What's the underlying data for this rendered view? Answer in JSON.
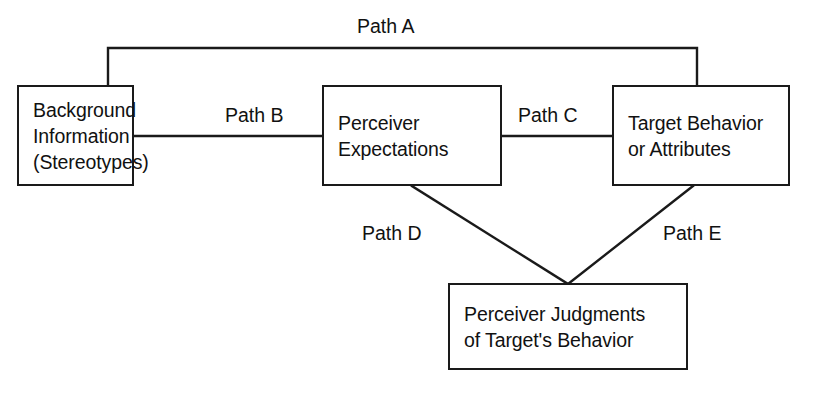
{
  "diagram": {
    "type": "path-model-flow-diagram",
    "stroke_color": "#1a1a1a",
    "background_color": "#ffffff",
    "text_color": "#111111",
    "nodes": [
      {
        "id": "background-information",
        "lines": [
          "Background",
          "Information",
          "(Stereotypes)"
        ],
        "x": 17,
        "y": 85,
        "width": 117,
        "height": 101,
        "align": "left"
      },
      {
        "id": "perceiver-expectations",
        "lines": [
          "Perceiver",
          "Expectations"
        ],
        "x": 322,
        "y": 85,
        "width": 180,
        "height": 101,
        "align": "left"
      },
      {
        "id": "target-behavior",
        "lines": [
          "Target Behavior",
          "or Attributes"
        ],
        "x": 612,
        "y": 85,
        "width": 178,
        "height": 101,
        "align": "left"
      },
      {
        "id": "perceiver-judgments",
        "lines": [
          "Perceiver Judgments",
          "of Target's Behavior"
        ],
        "x": 448,
        "y": 283,
        "width": 240,
        "height": 87,
        "align": "left"
      }
    ],
    "paths": [
      {
        "id": "path-a",
        "label": "Path A",
        "from": "background-information",
        "to": "target-behavior",
        "label_x": 357,
        "label_y": 15,
        "shape": "bracket-over-top"
      },
      {
        "id": "path-b",
        "label": "Path B",
        "from": "background-information",
        "to": "perceiver-expectations",
        "label_x": 225,
        "label_y": 104,
        "shape": "horizontal"
      },
      {
        "id": "path-c",
        "label": "Path C",
        "from": "perceiver-expectations",
        "to": "target-behavior",
        "label_x": 518,
        "label_y": 104,
        "shape": "horizontal"
      },
      {
        "id": "path-d",
        "label": "Path D",
        "from": "perceiver-expectations",
        "to": "perceiver-judgments",
        "label_x": 362,
        "label_y": 222,
        "shape": "diagonal"
      },
      {
        "id": "path-e",
        "label": "Path E",
        "from": "target-behavior",
        "to": "perceiver-judgments",
        "label_x": 663,
        "label_y": 222,
        "shape": "diagonal"
      }
    ],
    "connectors": {
      "path_a_bracket": {
        "left_x": 108,
        "right_x": 697,
        "top_y": 48
      },
      "path_b_line": {
        "x1": 134,
        "x2": 322,
        "y": 136
      },
      "path_c_line": {
        "x1": 502,
        "x2": 612,
        "y": 136
      },
      "path_d_line": {
        "x1": 412,
        "y1": 186,
        "x2": 568,
        "y2": 283
      },
      "path_e_line": {
        "x1": 693,
        "y1": 186,
        "x2": 568,
        "y2": 283
      }
    }
  }
}
